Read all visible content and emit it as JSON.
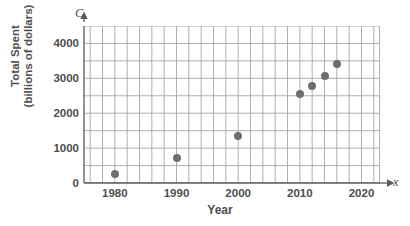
{
  "chart_data": {
    "type": "scatter",
    "title": "",
    "xlabel": "Year",
    "ylabel": "Total Spent (billions of dollars)",
    "ylabel_line1": "Total Spent",
    "ylabel_line2": "(billions of dollars)",
    "y_axis_letter": "C",
    "x_axis_letter": "x",
    "xlim": [
      1975,
      2023
    ],
    "ylim": [
      0,
      4500
    ],
    "x_ticks": [
      1980,
      1990,
      2000,
      2010,
      2020
    ],
    "y_ticks": [
      0,
      1000,
      2000,
      3000,
      4000
    ],
    "x_gridline_step": 2,
    "y_gridline_step": 500,
    "grid": true,
    "legend": "none",
    "marker_color": "#6e6e6e",
    "grid_color": "#9a9a9a",
    "axis_color": "#5a5a5a",
    "x": [
      1980,
      1990,
      2000,
      2010,
      2012,
      2014,
      2016
    ],
    "y": [
      250,
      720,
      1350,
      2560,
      2780,
      3060,
      3420
    ],
    "points": [
      {
        "x": 1980,
        "y": 250
      },
      {
        "x": 1990,
        "y": 720
      },
      {
        "x": 2000,
        "y": 1350
      },
      {
        "x": 2010,
        "y": 2560
      },
      {
        "x": 2012,
        "y": 2780
      },
      {
        "x": 2014,
        "y": 3060
      },
      {
        "x": 2016,
        "y": 3420
      }
    ]
  }
}
